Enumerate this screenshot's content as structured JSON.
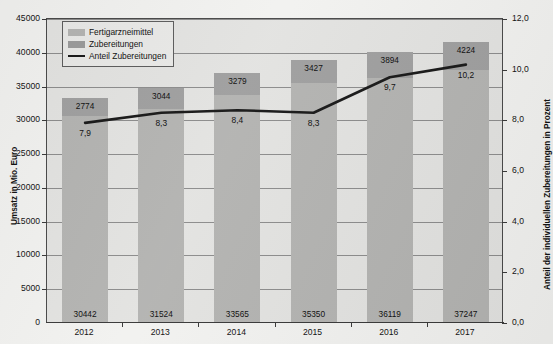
{
  "chart_data": {
    "type": "bar",
    "title": "",
    "subtitle": "",
    "xlabel": "",
    "ylabel": "Umsatz in Mio. Euro",
    "y2label": "Anteil der individuellen Zubereitungen in Prozent",
    "categories": [
      "2012",
      "2013",
      "2014",
      "2015",
      "2016",
      "2017"
    ],
    "ylim": [
      0,
      45000
    ],
    "y2lim": [
      0.0,
      12.0
    ],
    "ytick_labels": [
      "0",
      "5000",
      "10000",
      "15000",
      "20000",
      "25000",
      "30000",
      "35000",
      "40000",
      "45000"
    ],
    "ytick_values": [
      0,
      5000,
      10000,
      15000,
      20000,
      25000,
      30000,
      35000,
      40000,
      45000
    ],
    "y2tick_labels": [
      "0,0",
      "2,0",
      "4,0",
      "6,0",
      "8,0",
      "10,0",
      "12,0"
    ],
    "y2tick_values": [
      0.0,
      2.0,
      4.0,
      6.0,
      8.0,
      10.0,
      12.0
    ],
    "grid": true,
    "stacked": true,
    "legend_position": "top-left",
    "series": [
      {
        "name": "Fertigarzneimittel",
        "type": "bar",
        "axis": "left",
        "color": "#b4b4b2",
        "values": [
          30442,
          31524,
          33565,
          35350,
          36119,
          37247
        ],
        "value_labels": [
          "30442",
          "31524",
          "33565",
          "35350",
          "36119",
          "37247"
        ]
      },
      {
        "name": "Zubereitungen",
        "type": "bar",
        "axis": "left",
        "color": "#a0a0a0",
        "values": [
          2774,
          3044,
          3279,
          3427,
          3894,
          4224
        ],
        "value_labels": [
          "2774",
          "3044",
          "3279",
          "3427",
          "3894",
          "4224"
        ]
      },
      {
        "name": "Anteil Zubereitungen",
        "type": "line",
        "axis": "right",
        "color": "#1a1a1a",
        "values": [
          7.9,
          8.3,
          8.4,
          8.3,
          9.7,
          10.2
        ],
        "value_labels": [
          "7,9",
          "8,3",
          "8,4",
          "8,3",
          "9,7",
          "10,2"
        ]
      }
    ]
  },
  "legend": {
    "items": [
      {
        "label": "Fertigarzneimittel",
        "swatch": "bar-light"
      },
      {
        "label": "Zubereitungen",
        "swatch": "bar-dark"
      },
      {
        "label": "Anteil Zubereitungen",
        "swatch": "line-black"
      }
    ]
  },
  "colors": {
    "plot_background": "#e3e3e1",
    "bar_lower": "#b4b4b2",
    "bar_upper": "#a0a0a0",
    "line": "#1a1a1a",
    "gridline": "#8d8d8d",
    "axis": "#3a3a3a",
    "page_background": "#f2f2f0"
  }
}
